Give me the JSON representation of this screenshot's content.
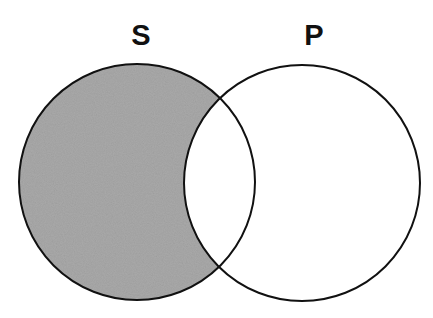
{
  "diagram": {
    "type": "venn",
    "sets": [
      {
        "id": "S",
        "label": "S",
        "cx": 137,
        "cy": 182,
        "r": 118,
        "label_x": 141,
        "label_y": 45
      },
      {
        "id": "P",
        "label": "P",
        "cx": 302,
        "cy": 183,
        "r": 118,
        "label_x": 314,
        "label_y": 45
      }
    ],
    "shaded_region": "S minus P",
    "colors": {
      "shade": "#a9a9a9",
      "stroke": "#111111",
      "background": "#ffffff"
    }
  }
}
